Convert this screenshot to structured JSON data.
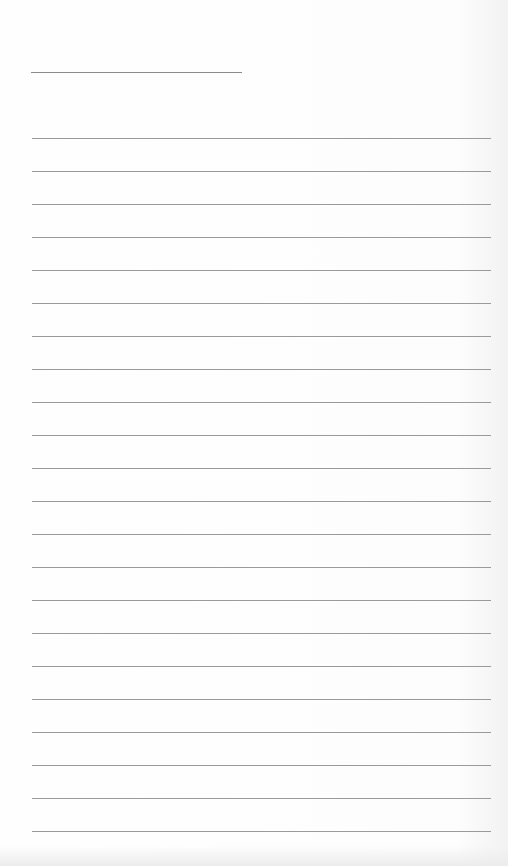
{
  "paper": {
    "type": "lined-paper",
    "background_color": "#fdfdfd",
    "line_color": "#9a9a9a",
    "title_line": {
      "x": 31,
      "y": 72,
      "width": 211
    },
    "rules": {
      "start_y": 138,
      "spacing": 33,
      "count": 22,
      "x": 32,
      "width": 459
    }
  }
}
